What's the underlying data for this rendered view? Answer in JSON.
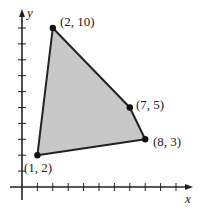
{
  "chart_data": {
    "type": "area",
    "title": "",
    "xlabel": "x",
    "ylabel": "y",
    "xlim": [
      -1,
      11
    ],
    "ylim": [
      -1,
      11
    ],
    "grid": false,
    "polygon": {
      "vertices": [
        {
          "x": 1,
          "y": 2,
          "label": "(1, 2)"
        },
        {
          "x": 2,
          "y": 10,
          "label": "(2, 10)"
        },
        {
          "x": 7,
          "y": 5,
          "label": "(7, 5)"
        },
        {
          "x": 8,
          "y": 3,
          "label": "(8, 3)"
        }
      ],
      "fill": "#c8c8c8",
      "stroke": "#222222"
    },
    "x_ticks": [
      1,
      2,
      3,
      4,
      5,
      6,
      7,
      8,
      9,
      10
    ],
    "y_ticks": [
      1,
      2,
      3,
      4,
      5,
      6,
      7,
      8,
      9,
      10
    ]
  },
  "axes": {
    "x_label": "x",
    "y_label": "y"
  },
  "labels": {
    "p1": "(1, 2)",
    "p2": "(2, 10)",
    "p3": "(7, 5)",
    "p4": "(8, 3)"
  }
}
